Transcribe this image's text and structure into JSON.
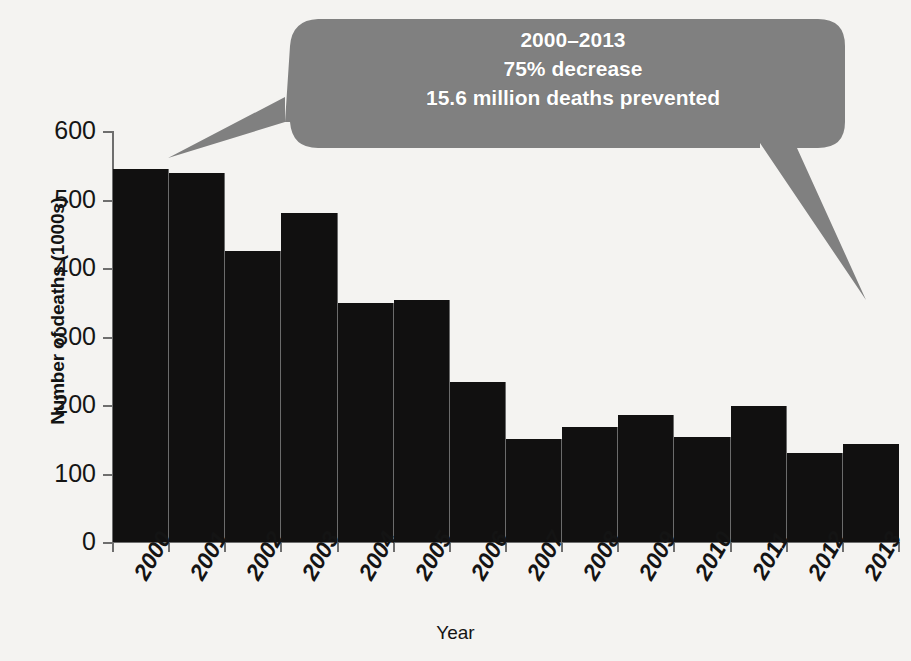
{
  "figure": {
    "background_color": "#f4f3f1",
    "bar_color": "#111010",
    "callout_color": "#808080",
    "callout_text_color": "#ffffff"
  },
  "callout": {
    "line1": "2000–2013",
    "line2": "75% decrease",
    "line3": "15.6 million deaths prevented"
  },
  "axes": {
    "ylabel": "Number of deaths (1000s)",
    "xlabel": "Year",
    "yticks": [
      "600",
      "500",
      "400",
      "300",
      "200",
      "100",
      "0"
    ]
  },
  "chart_data": {
    "type": "bar",
    "title": "",
    "xlabel": "Year",
    "ylabel": "Number of deaths (1000s)",
    "ylim": [
      0,
      600
    ],
    "yticks": [
      0,
      100,
      200,
      300,
      400,
      500,
      600
    ],
    "grid": false,
    "legend": "none",
    "categories": [
      "2000",
      "2001",
      "2002",
      "2003",
      "2004",
      "2005",
      "2006",
      "2007",
      "2008",
      "2009",
      "2010",
      "2011",
      "2012",
      "2013"
    ],
    "values": [
      545,
      539,
      425,
      480,
      349,
      353,
      233,
      150,
      168,
      186,
      153,
      199,
      130,
      143
    ],
    "annotations": [
      "2000–2013",
      "75% decrease",
      "15.6 million deaths prevented"
    ]
  }
}
